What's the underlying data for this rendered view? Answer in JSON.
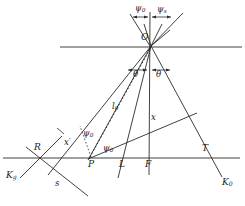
{
  "figure": {
    "type": "geometric-optics-ray-diagram",
    "background_color": "#ffffff",
    "line_color": "#2b2b2b",
    "text_color": "#1a1a1a",
    "points": {
      "O": {
        "label": "O",
        "x": 151,
        "y": 46
      },
      "P": {
        "label": "P",
        "x": 90,
        "y": 158
      },
      "R": {
        "label": "R",
        "x": 40,
        "y": 158
      },
      "L": {
        "label": "L",
        "x": 123,
        "y": 158
      },
      "F": {
        "label": "F",
        "x": 148,
        "y": 158
      },
      "T": {
        "label": "T",
        "x": 205,
        "y": 158
      }
    },
    "point_labels": [
      {
        "name": "point-label-O",
        "text": "O",
        "sub": "",
        "x": 141,
        "y": 37
      },
      {
        "name": "point-label-P",
        "text": "P",
        "sub": "",
        "x": 89,
        "y": 161
      },
      {
        "name": "point-label-R",
        "text": "R",
        "sub": "",
        "x": 35,
        "y": 145
      },
      {
        "name": "point-label-L",
        "text": "L",
        "sub": "",
        "x": 120,
        "y": 161
      },
      {
        "name": "point-label-F",
        "text": "F",
        "sub": "",
        "x": 146,
        "y": 161
      },
      {
        "name": "point-label-T",
        "text": "T",
        "sub": "",
        "x": 203,
        "y": 146
      }
    ],
    "axis_labels": [
      {
        "name": "axis-label-kg",
        "text": "K",
        "sub": "g",
        "x": 8,
        "y": 173
      },
      {
        "name": "axis-label-k0",
        "text": "K",
        "sub": "0",
        "x": 224,
        "y": 180
      }
    ],
    "segment_labels": [
      {
        "name": "segment-label-l0",
        "text": "l",
        "sub": "0",
        "x": 113,
        "y": 106
      },
      {
        "name": "segment-label-x",
        "text": "x",
        "sub": "",
        "x": 152,
        "y": 117
      },
      {
        "name": "segment-label-xprime",
        "text": "x′",
        "sub": "",
        "x": 66,
        "y": 142
      },
      {
        "name": "segment-label-s",
        "text": "s",
        "sub": "",
        "x": 56,
        "y": 183
      }
    ],
    "angle_labels": [
      {
        "name": "angle-label-psi0-top",
        "text": "ψ",
        "sub": "0",
        "x": 137,
        "y": 8
      },
      {
        "name": "angle-label-psis-top",
        "text": "ψ",
        "sub": "s",
        "x": 158,
        "y": 9
      },
      {
        "name": "angle-label-theta-left",
        "text": "θ",
        "sub": "",
        "x": 134,
        "y": 73
      },
      {
        "name": "angle-label-theta-right",
        "text": "θ",
        "sub": "",
        "x": 157,
        "y": 73
      },
      {
        "name": "angle-label-psi0-mid",
        "text": "ψ",
        "sub": "0",
        "x": 84,
        "y": 133
      },
      {
        "name": "angle-label-psi0-base",
        "text": "ψ",
        "sub": "0",
        "x": 104,
        "y": 148
      }
    ]
  }
}
